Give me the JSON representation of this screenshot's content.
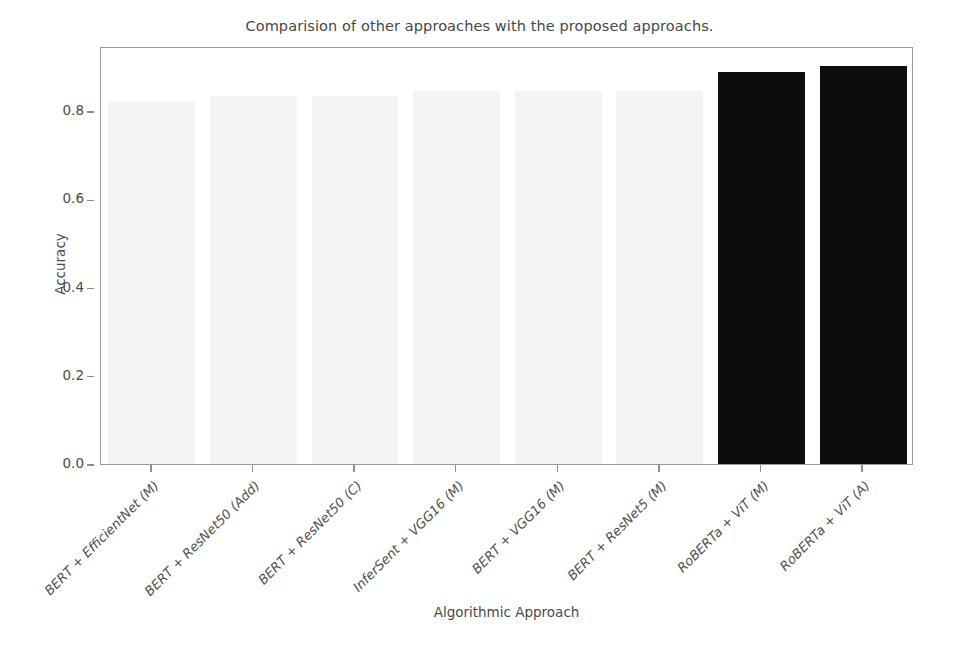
{
  "chart_data": {
    "type": "bar",
    "title": "Comparision of other approaches with the proposed approachs.",
    "xlabel": "Algorithmic Approach",
    "ylabel": "Accuracy",
    "categories": [
      "BERT + EfficientNet (M)",
      "BERT + ResNet50 (Add)",
      "BERT + ResNet50 (C)",
      "InferSent + VGG16 (M)",
      "BERT + VGG16 (M)",
      "BERT + ResNet5 (M)",
      "RoBERTa + ViT (M)",
      "RoBERTa + ViT (A)"
    ],
    "values": [
      0.82,
      0.835,
      0.835,
      0.845,
      0.845,
      0.845,
      0.888,
      0.902
    ],
    "bar_colors": [
      "#f4f4f4",
      "#f4f4f4",
      "#f4f4f4",
      "#f4f4f4",
      "#f4f4f4",
      "#f4f4f4",
      "#0d0d0d",
      "#0d0d0d"
    ],
    "ylim": [
      0.0,
      0.9475
    ],
    "ytick_labels": [
      "0.0",
      "0.2",
      "0.4",
      "0.6",
      "0.8"
    ],
    "ytick_values": [
      0.0,
      0.2,
      0.4,
      0.6,
      0.8
    ],
    "grid": false,
    "legend": "none"
  },
  "axes": {
    "frame_color": "#9a9a9a",
    "tick_color": "#8e8e8e",
    "text_color": "#4a4a4a"
  }
}
